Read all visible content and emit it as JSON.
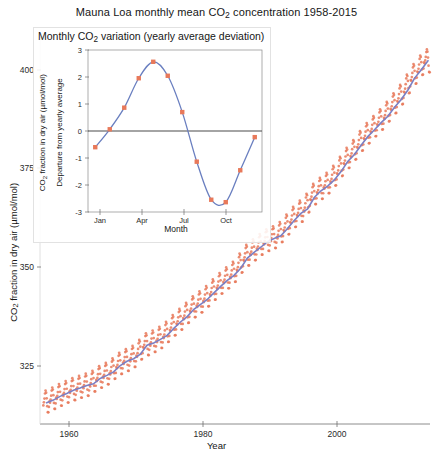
{
  "figure": {
    "title": "Mauna Loa monthly mean CO2 concentration 1958-2015",
    "title_pre": "Mauna Loa monthly mean CO",
    "title_sub": "2",
    "title_post": " concentration 1958-2015",
    "background": "#ffffff",
    "marker_color": "#e8795a",
    "line_color": "#7b7fc4",
    "axis_color": "#6e6e6e",
    "inset_border_color": "#e2e2e2"
  },
  "main_axes": {
    "xlabel": "Year",
    "ylabel_pre": "CO",
    "ylabel_sub": "2",
    "ylabel_post": " fraction in dry air (µmol/mol)",
    "ylabel": "CO2 fraction in dry air (µmol/mol)",
    "yticks": [
      "400",
      "375",
      "350",
      "325"
    ],
    "xticks": [
      "1960",
      "1980",
      "2000"
    ]
  },
  "inset_axes": {
    "title_pre": "Monthly CO",
    "title_sub": "2",
    "title_post": " variation (yearly average deviation)",
    "title": "Monthly CO2 variation (yearly average deviation)",
    "xlabel": "Month",
    "ylabel": "Departure from yearly average",
    "ylabel_outer_pre": "CO",
    "ylabel_outer_sub": "2",
    "ylabel_outer_post": " fraction in dry air (µmol/mol)",
    "ylabel_outer": "CO2 fraction in dry air (µmol/mol)",
    "yticks": [
      "3",
      "2",
      "1",
      "0",
      "-1",
      "-2",
      "-3"
    ],
    "xticks": [
      "Jan",
      "Apr",
      "Jul",
      "Oct"
    ]
  },
  "chart_data": [
    {
      "type": "scatter",
      "id": "main",
      "title": "Mauna Loa monthly mean CO2 concentration 1958-2015",
      "xlabel": "Year",
      "ylabel": "CO2 fraction in dry air (µmol/mol)",
      "xlim": [
        1957.5,
        2015.8
      ],
      "ylim": [
        310,
        407
      ],
      "xticks": [
        1960,
        1980,
        2000
      ],
      "yticks": [
        325,
        350,
        375,
        400
      ],
      "grid": false,
      "legend": "none",
      "series": [
        {
          "name": "Monthly mean CO2",
          "style": "markers",
          "color": "#e8795a",
          "note": "Monthly observations 1958-2015, seasonal oscillation of about +/-3 umol/mol superposed on the rising trend",
          "x": [
            1958,
            1959,
            1960,
            1961,
            1962,
            1963,
            1964,
            1965,
            1966,
            1967,
            1968,
            1969,
            1970,
            1971,
            1972,
            1973,
            1974,
            1975,
            1976,
            1977,
            1978,
            1979,
            1980,
            1981,
            1982,
            1983,
            1984,
            1985,
            1986,
            1987,
            1988,
            1989,
            1990,
            1991,
            1992,
            1993,
            1994,
            1995,
            1996,
            1997,
            1998,
            1999,
            2000,
            2001,
            2002,
            2003,
            2004,
            2005,
            2006,
            2007,
            2008,
            2009,
            2010,
            2011,
            2012,
            2013,
            2014,
            2015
          ],
          "y": [
            315.3,
            315.98,
            316.91,
            317.64,
            318.45,
            318.99,
            319.62,
            320.04,
            321.38,
            322.16,
            323.04,
            324.62,
            325.68,
            326.32,
            327.45,
            329.68,
            330.25,
            331.15,
            332.15,
            333.9,
            335.5,
            336.85,
            338.69,
            339.93,
            341.13,
            342.78,
            344.42,
            345.9,
            347.15,
            348.93,
            351.48,
            352.91,
            354.19,
            355.59,
            356.37,
            357.04,
            358.89,
            360.88,
            362.64,
            363.76,
            366.63,
            368.31,
            369.48,
            371.02,
            373.1,
            375.64,
            377.38,
            379.67,
            381.84,
            383.55,
            385.34,
            386.94,
            389.21,
            391.15,
            393.51,
            396.48,
            398.55,
            400.83
          ]
        },
        {
          "name": "Smoothed trend",
          "style": "line",
          "color": "#7b7fc4",
          "note": "Yearly average / smoothed trend line through the monthly scatter"
        }
      ]
    },
    {
      "type": "line",
      "id": "inset",
      "title": "Monthly CO2 variation (yearly average deviation)",
      "xlabel": "Month",
      "ylabel": "Departure from yearly average",
      "categories": [
        "Jan",
        "Feb",
        "Mar",
        "Apr",
        "May",
        "Jun",
        "Jul",
        "Aug",
        "Sep",
        "Oct",
        "Nov",
        "Dec"
      ],
      "xlim": [
        0.5,
        12.5
      ],
      "ylim": [
        -3.3,
        3.3
      ],
      "xticks": [
        "Jan",
        "Apr",
        "Jul",
        "Oct"
      ],
      "yticks": [
        -3,
        -2,
        -1,
        0,
        1,
        2,
        3
      ],
      "grid": false,
      "legend": "none",
      "zero_line": true,
      "series": [
        {
          "name": "Departure from yearly average",
          "marker_color": "#e8795a",
          "line_color": "#6a7fc0",
          "values": [
            -0.66,
            0.07,
            0.95,
            2.15,
            2.82,
            2.25,
            0.77,
            -1.25,
            -2.8,
            -2.9,
            -1.6,
            -0.25
          ]
        }
      ]
    }
  ]
}
